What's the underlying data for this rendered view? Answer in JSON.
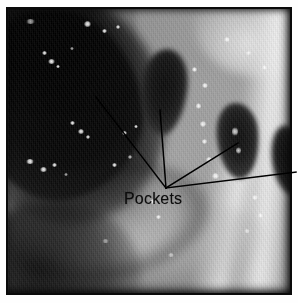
{
  "figure": {
    "kind": "annotated-endoscopic-photograph",
    "modality_description": "Grayscale endoscopic view of mucosal lumen with multiple dark recesses"
  },
  "annotation": {
    "label": "Pockets",
    "label_color": "#0d0d0d",
    "line_color": "#000000",
    "converge_point": {
      "x": 166,
      "y": 188
    },
    "leader_lines": [
      {
        "id": "leader-1",
        "target_name": "pocket-upper-left",
        "x1": 166,
        "y1": 188,
        "x2": 96,
        "y2": 97
      },
      {
        "id": "leader-2",
        "target_name": "pocket-center",
        "x1": 166,
        "y1": 188,
        "x2": 160,
        "y2": 110
      },
      {
        "id": "leader-3",
        "target_name": "pocket-right",
        "x1": 166,
        "y1": 188,
        "x2": 238,
        "y2": 143
      },
      {
        "id": "leader-4",
        "target_name": "pocket-far-right",
        "x1": 166,
        "y1": 188,
        "x2": 296,
        "y2": 172
      }
    ],
    "label_position": {
      "x": 124,
      "y": 190
    }
  },
  "image_regions": [
    {
      "name": "lumen-main",
      "tone": "very-dark",
      "description": "Large dark lumen opening, upper-left"
    },
    {
      "name": "pocket-center",
      "tone": "dark",
      "description": "Central vertical dark pocket"
    },
    {
      "name": "pocket-right",
      "tone": "dark",
      "description": "Right-side dark pocket"
    },
    {
      "name": "pocket-far-right",
      "tone": "dark",
      "description": "Far-right edge dark pocket"
    },
    {
      "name": "bright-fold",
      "tone": "bright",
      "description": "Bright vertical mucosal fold on the right"
    },
    {
      "name": "lower-band",
      "tone": "mid",
      "description": "Lower mucosal band sweeping left to right"
    }
  ],
  "palette": {
    "page_background": "#ffffff",
    "plate_border": "#0a0a0a",
    "darkest": "#030303",
    "midtone": "#9a9a9a",
    "brightest": "#f8f8f8"
  }
}
